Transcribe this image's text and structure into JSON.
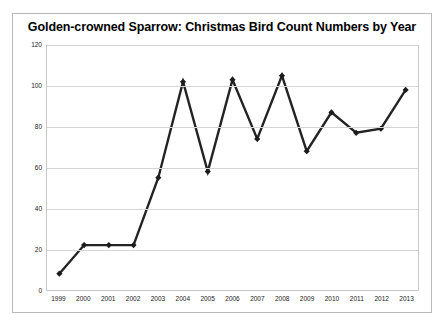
{
  "chart_data": {
    "type": "line",
    "title": "Golden-crowned Sparrow: Christmas Bird Count Numbers by Year",
    "xlabel": "",
    "ylabel": "",
    "categories": [
      "1999",
      "2000",
      "2001",
      "2002",
      "2003",
      "2004",
      "2005",
      "2006",
      "2007",
      "2008",
      "2009",
      "2010",
      "2011",
      "2012",
      "2013"
    ],
    "values": [
      8,
      22,
      22,
      22,
      55,
      102,
      58,
      103,
      74,
      105,
      68,
      87,
      77,
      79,
      98
    ],
    "series": [
      {
        "name": "Golden-crowned Sparrow count",
        "values": [
          8,
          22,
          22,
          22,
          55,
          102,
          58,
          103,
          74,
          105,
          68,
          87,
          77,
          79,
          98
        ]
      }
    ],
    "ylim": [
      0,
      120
    ],
    "yticks": [
      0,
      20,
      40,
      60,
      80,
      100,
      120
    ],
    "ytick_labels": [
      "0",
      "20",
      "40",
      "60",
      "80",
      "100",
      "120"
    ],
    "grid": "horizontal",
    "legend": "none",
    "marker": "diamond",
    "line_color": "#232323",
    "marker_color": "#1c1c1c",
    "grid_color": "#d4d4d4",
    "background_color": "#ffffff",
    "border_color": "#b9b9b9"
  }
}
